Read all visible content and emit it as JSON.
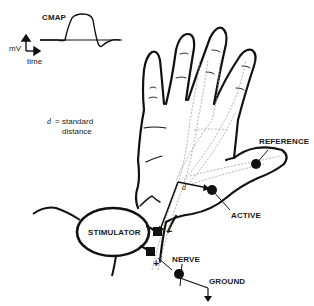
{
  "diagram": {
    "waveform": {
      "label": "CMAP",
      "y_axis_label": "mV",
      "x_axis_label": "time"
    },
    "distance_note": {
      "symbol": "d",
      "equals": "=",
      "line1": "standard",
      "line2": "distance"
    },
    "d_marker": "d",
    "electrodes": {
      "reference": "REFERENCE",
      "active": "ACTIVE",
      "ground": "GROUND"
    },
    "stimulator": {
      "label": "STIMULATOR",
      "cathode": "−",
      "anode": "+"
    },
    "nerve_label": "NERVE",
    "colors": {
      "ink": "#111111",
      "nerve_dash": "#9a9a9a",
      "background": "#ffffff"
    }
  }
}
